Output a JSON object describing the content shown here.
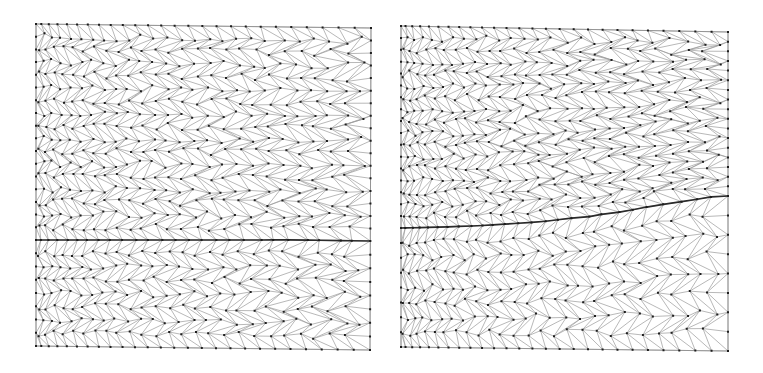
{
  "figure": {
    "width": 763,
    "height": 373,
    "background_color": "#ffffff",
    "panel_count": 2,
    "caption_text": ""
  },
  "style": {
    "mesh_edge_color": "#9a9a9a",
    "mesh_edge_width": 0.7,
    "boundary_edge_color": "#8c8c8c",
    "boundary_edge_width": 0.8,
    "vertex_color": "#1e1e1e",
    "vertex_radius": 1.0,
    "interface_color": "#2b2b2b",
    "interface_width": 1.7
  },
  "panels": [
    {
      "id": "left-panel",
      "name": "mesh-panel-left",
      "label": "",
      "domain": {
        "corners": {
          "top_left": [
            36,
            24
          ],
          "top_right": [
            371,
            28
          ],
          "bottom_right": [
            370,
            350
          ],
          "bottom_left": [
            36,
            346
          ]
        }
      },
      "mesh": {
        "type": "unstructured-triangular",
        "nominal_columns": 26,
        "nominal_rows": 25,
        "refinement": {
          "direction": "rightward",
          "min_scale": 1.0,
          "max_scale": 1.65,
          "description": "element density increases toward the right edge"
        },
        "jitter_amplitude": 0.3,
        "approx_vertex_count": 690,
        "approx_element_count": 1280
      },
      "interface": {
        "name": "material-interface-curve",
        "shape": "flat",
        "points": [
          [
            36,
            240
          ],
          [
            104,
            240
          ],
          [
            171,
            240
          ],
          [
            238,
            240
          ],
          [
            305,
            240
          ],
          [
            371,
            241
          ]
        ],
        "amplitude_px": 1
      }
    },
    {
      "id": "right-panel",
      "name": "mesh-panel-right",
      "label": "",
      "domain": {
        "corners": {
          "top_left": [
            401,
            26
          ],
          "top_right": [
            728,
            32
          ],
          "bottom_right": [
            728,
            351
          ],
          "bottom_left": [
            401,
            347
          ]
        }
      },
      "mesh": {
        "type": "unstructured-triangular",
        "nominal_columns": 26,
        "nominal_rows": 25,
        "refinement": {
          "direction": "rightward",
          "min_scale": 1.0,
          "max_scale": 1.75,
          "description": "element density increases toward the right edge, strongest near the interface"
        },
        "jitter_amplitude": 0.3,
        "approx_vertex_count": 720,
        "approx_element_count": 1340
      },
      "interface": {
        "name": "material-interface-curve",
        "shape": "rising-curve",
        "points": [
          [
            401,
            228
          ],
          [
            447,
            227
          ],
          [
            493,
            225
          ],
          [
            539,
            222
          ],
          [
            585,
            217
          ],
          [
            631,
            210
          ],
          [
            677,
            202
          ],
          [
            710,
            197
          ],
          [
            728,
            196
          ]
        ],
        "amplitude_px": 32
      }
    }
  ]
}
